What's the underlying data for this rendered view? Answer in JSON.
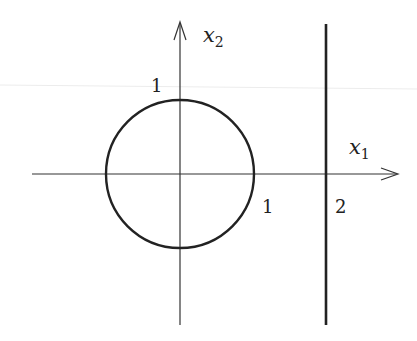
{
  "diagram": {
    "colors": {
      "background": "#ffffff",
      "ink": "#222222",
      "artifact": "#e6e6e6"
    },
    "axes": {
      "x1": {
        "label_main": "x",
        "label_sub": "1"
      },
      "x2": {
        "label_main": "x",
        "label_sub": "2"
      }
    },
    "ticks": {
      "x2_one": "1",
      "x1_one": "1",
      "x1_two": "2"
    },
    "shapes": {
      "circle": {
        "center": [
          0,
          0
        ],
        "radius": 1
      },
      "vertical_line": {
        "x1": 2
      }
    }
  }
}
